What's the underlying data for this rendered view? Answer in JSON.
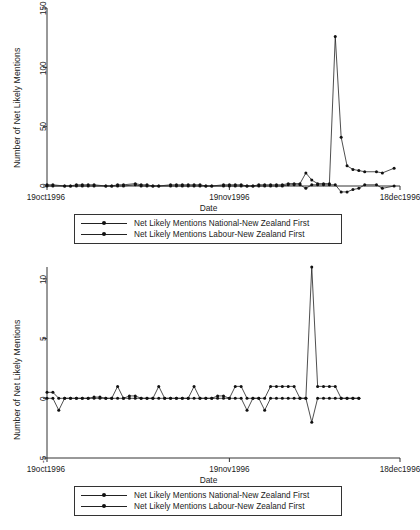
{
  "figure": {
    "title": "",
    "panels": [
      {
        "id": "top",
        "ylabel": "Number of Net Likely Mentions",
        "xlabel": "Date",
        "yticks": [
          "150",
          "100",
          "50",
          "0"
        ],
        "xticks": [
          "19oct1996",
          "19nov1996",
          "18dec1996"
        ],
        "legend": [
          {
            "label": "Net Likely Mentions National-New Zealand First",
            "key": "series-national"
          },
          {
            "label": "Net Likely Mentions Labour-New Zealand First",
            "key": "series-labour"
          }
        ]
      },
      {
        "id": "bottom",
        "ylabel": "Number of Net Likely Mentions",
        "xlabel": "Date",
        "yticks": [
          "10",
          "5",
          "0",
          "-5"
        ],
        "xticks": [
          "19oct1996",
          "19nov1996",
          "18dec1996"
        ],
        "legend": [
          {
            "label": "Net Likely Mentions National-New Zealand First",
            "key": "series-national"
          },
          {
            "label": "Net Likely Mentions Labour-New Zealand First",
            "key": "series-labour"
          }
        ]
      }
    ]
  },
  "chart_data": [
    {
      "type": "line",
      "panel": "top",
      "title": "",
      "xlabel": "Date",
      "ylabel": "Number of Net Likely Mentions",
      "xlim": [
        0,
        60
      ],
      "ylim": [
        0,
        150
      ],
      "ytick_values": [
        0,
        50,
        100,
        150
      ],
      "xtick_values": [
        0,
        31,
        60
      ],
      "xtick_labels": [
        "19oct1996",
        "19nov1996",
        "18dec1996"
      ],
      "grid": false,
      "legend_position": "below",
      "series": [
        {
          "name": "Net Likely Mentions National-New Zealand First",
          "marker": "circle",
          "x": [
            0,
            1,
            3,
            4,
            5,
            6,
            7,
            8,
            10,
            11,
            12,
            13,
            15,
            16,
            17,
            18,
            19,
            21,
            22,
            23,
            24,
            25,
            26,
            27,
            28,
            30,
            31,
            32,
            33,
            34,
            35,
            36,
            37,
            38,
            39,
            40,
            41,
            42,
            43,
            44,
            45,
            46,
            47,
            48,
            49,
            50,
            51,
            52,
            53,
            54,
            56,
            57,
            59
          ],
          "y": [
            1,
            1,
            0,
            0,
            1,
            1,
            1,
            1,
            0,
            0,
            1,
            1,
            2,
            1,
            1,
            0,
            0,
            1,
            1,
            1,
            1,
            1,
            1,
            0,
            0,
            1,
            1,
            1,
            1,
            0,
            0,
            1,
            1,
            1,
            1,
            1,
            2,
            2,
            2,
            11,
            5,
            2,
            2,
            2,
            126,
            41,
            17,
            14,
            13,
            12,
            12,
            11,
            15
          ]
        },
        {
          "name": "Net Likely Mentions Labour-New Zealand First",
          "marker": "circle",
          "x": [
            0,
            1,
            3,
            4,
            5,
            6,
            7,
            8,
            10,
            11,
            12,
            13,
            15,
            16,
            17,
            18,
            19,
            21,
            22,
            23,
            24,
            25,
            26,
            27,
            28,
            30,
            31,
            32,
            33,
            34,
            35,
            36,
            37,
            38,
            39,
            40,
            41,
            42,
            43,
            44,
            45,
            46,
            47,
            48,
            49,
            50,
            51,
            52,
            53,
            54,
            56,
            57,
            59
          ],
          "y": [
            0,
            0,
            0,
            0,
            0,
            0,
            0,
            0,
            0,
            0,
            0,
            0,
            1,
            0,
            0,
            0,
            0,
            0,
            0,
            0,
            0,
            0,
            0,
            0,
            0,
            0,
            0,
            0,
            0,
            0,
            0,
            0,
            0,
            0,
            0,
            0,
            1,
            1,
            1,
            -2,
            1,
            1,
            1,
            1,
            1,
            -5,
            -5,
            -3,
            -2,
            1,
            1,
            -2,
            0
          ]
        }
      ]
    },
    {
      "type": "line",
      "panel": "bottom",
      "title": "",
      "xlabel": "Date",
      "ylabel": "Number of Net Likely Mentions",
      "xlim": [
        0,
        60
      ],
      "ylim": [
        -5,
        11
      ],
      "ytick_values": [
        -5,
        0,
        5,
        10
      ],
      "xtick_values": [
        0,
        31,
        60
      ],
      "xtick_labels": [
        "19oct1996",
        "19nov1996",
        "18dec1996"
      ],
      "grid": false,
      "legend_position": "below",
      "series": [
        {
          "name": "Net Likely Mentions National-New Zealand First",
          "marker": "circle",
          "x": [
            0,
            1,
            2,
            3,
            4,
            5,
            6,
            7,
            8,
            9,
            10,
            11,
            12,
            13,
            14,
            15,
            16,
            17,
            18,
            19,
            20,
            21,
            22,
            23,
            24,
            25,
            26,
            27,
            28,
            29,
            30,
            31,
            32,
            33,
            34,
            35,
            36,
            37,
            38,
            39,
            40,
            41,
            42,
            43,
            44,
            45,
            46,
            47,
            48,
            49,
            50,
            51,
            52,
            53
          ],
          "y": [
            0.5,
            0.5,
            0,
            0,
            0,
            0,
            0,
            0,
            0.1,
            0.1,
            0,
            0,
            1,
            0,
            0.2,
            0.2,
            0,
            0,
            0,
            1,
            0,
            0,
            0,
            0,
            0,
            1,
            0,
            0,
            0,
            0.2,
            0.2,
            0,
            1,
            1,
            0,
            0,
            0,
            0,
            1,
            1,
            1,
            1,
            1,
            0,
            0,
            11,
            1,
            1,
            1,
            1,
            0,
            0,
            0,
            0
          ]
        },
        {
          "name": "Net Likely Mentions Labour-New Zealand First",
          "marker": "circle",
          "x": [
            0,
            1,
            2,
            3,
            4,
            5,
            6,
            7,
            8,
            9,
            10,
            11,
            12,
            13,
            14,
            15,
            16,
            17,
            18,
            19,
            20,
            21,
            22,
            23,
            24,
            25,
            26,
            27,
            28,
            29,
            30,
            31,
            32,
            33,
            34,
            35,
            36,
            37,
            38,
            39,
            40,
            41,
            42,
            43,
            44,
            45,
            46,
            47,
            48,
            49,
            50,
            51,
            52,
            53
          ],
          "y": [
            0,
            0,
            -1,
            0,
            0,
            0,
            0,
            0,
            0,
            0,
            0,
            0,
            0,
            0,
            0,
            0,
            0,
            0,
            0,
            0,
            0,
            0,
            0,
            0,
            0,
            0,
            0,
            0,
            0,
            0,
            0,
            0,
            0,
            0,
            -1,
            0,
            0,
            -1,
            0,
            0,
            0,
            0,
            0,
            0,
            0,
            -2,
            0,
            0,
            0,
            0,
            0,
            0,
            0,
            0
          ]
        }
      ]
    }
  ],
  "colors": {
    "line": "#222222",
    "marker": "#111111",
    "axis": "#333333",
    "background": "#ffffff"
  }
}
